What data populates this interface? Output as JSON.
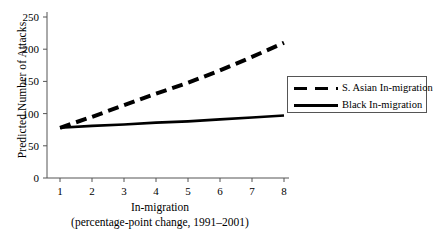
{
  "chart_data": {
    "type": "line",
    "title": "",
    "xlabel": "In-migration",
    "xlabel_sub": "(percentage-point change, 1991–2001)",
    "ylabel": "Predicted Number of Attacks",
    "xlim": [
      0.5,
      8.5
    ],
    "ylim": [
      0,
      250
    ],
    "grid": false,
    "legend_position": "right",
    "x": [
      1,
      2,
      3,
      4,
      5,
      6,
      7,
      8
    ],
    "xticks": [
      "1",
      "2",
      "3",
      "4",
      "5",
      "6",
      "7",
      "8"
    ],
    "yticks": [
      "0",
      "50",
      "100",
      "150",
      "200",
      "250"
    ],
    "ytick_values": [
      0,
      50,
      100,
      150,
      200,
      250
    ],
    "series": [
      {
        "name": "S. Asian In-migration",
        "style": "dashed",
        "color": "#000000",
        "values": [
          78,
          95,
          113,
          131,
          148,
          167,
          188,
          210
        ]
      },
      {
        "name": "Black In-migration",
        "style": "solid",
        "color": "#000000",
        "values": [
          78,
          81,
          83,
          86,
          88,
          91,
          94,
          97
        ]
      }
    ]
  },
  "legend": {
    "items": [
      {
        "label": "S. Asian In-migration",
        "style": "dashed"
      },
      {
        "label": "Black In-migration",
        "style": "solid"
      }
    ]
  }
}
